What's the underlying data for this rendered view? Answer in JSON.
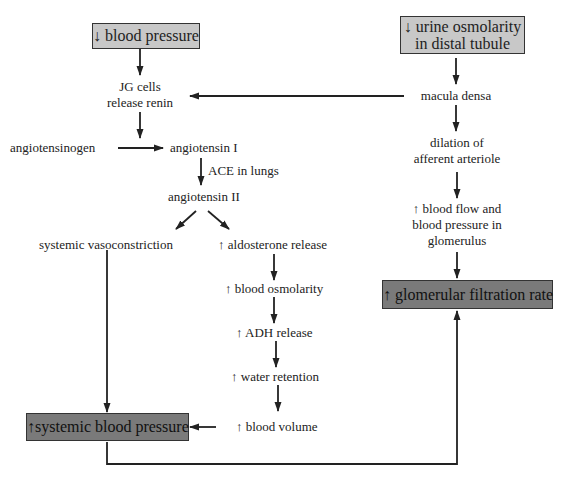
{
  "diagram": {
    "colors": {
      "start_box_fill": "#c8c8c8",
      "end_box_fill": "#7a7a7a",
      "arrow": "#222222",
      "text": "#222222"
    },
    "nodes": {
      "decreased_bp": {
        "text": "↓ blood pressure",
        "style": "light-box"
      },
      "decreased_urine_osm": {
        "lines": [
          "↓ urine osmolarity",
          "in distal tubule"
        ],
        "style": "light-box"
      },
      "jg_cells": {
        "lines": [
          "JG cells",
          "release renin"
        ]
      },
      "macula_densa": {
        "text": "macula densa"
      },
      "angiotensinogen": {
        "text": "angiotensinogen"
      },
      "angiotensin_1": {
        "text": "angiotensin I"
      },
      "ace_label": {
        "text": "ACE in lungs"
      },
      "angiotensin_2": {
        "text": "angiotensin II"
      },
      "dilation": {
        "lines": [
          "dilation of",
          "afferent arteriole"
        ]
      },
      "blood_flow": {
        "lines": [
          "↑ blood flow and",
          "blood pressure in",
          "glomerulus"
        ]
      },
      "vasoconstriction": {
        "text": "systemic vasoconstriction"
      },
      "aldosterone": {
        "text": "↑ aldosterone release"
      },
      "blood_osm": {
        "text": "↑ blood osmolarity"
      },
      "adh": {
        "text": "↑ ADH release"
      },
      "water_retention": {
        "text": "↑ water retention"
      },
      "blood_volume": {
        "text": "↑ blood volume"
      },
      "systemic_bp": {
        "text": "↑systemic blood pressure",
        "style": "dark-box"
      },
      "gfr": {
        "text": "↑ glomerular filtration rate",
        "style": "dark-box"
      }
    },
    "edges": [
      {
        "from": "decreased_bp",
        "to": "jg_cells"
      },
      {
        "from": "decreased_urine_osm",
        "to": "macula_densa"
      },
      {
        "from": "macula_densa",
        "to": "jg_cells"
      },
      {
        "from": "macula_densa",
        "to": "dilation"
      },
      {
        "from": "jg_cells",
        "to": "angiotensin_1"
      },
      {
        "from": "angiotensinogen",
        "to": "angiotensin_1"
      },
      {
        "from": "angiotensin_1",
        "to": "angiotensin_2",
        "label": "ACE in lungs"
      },
      {
        "from": "angiotensin_2",
        "to": "vasoconstriction"
      },
      {
        "from": "angiotensin_2",
        "to": "aldosterone"
      },
      {
        "from": "aldosterone",
        "to": "blood_osm"
      },
      {
        "from": "blood_osm",
        "to": "adh"
      },
      {
        "from": "adh",
        "to": "water_retention"
      },
      {
        "from": "water_retention",
        "to": "blood_volume"
      },
      {
        "from": "blood_volume",
        "to": "systemic_bp"
      },
      {
        "from": "vasoconstriction",
        "to": "systemic_bp"
      },
      {
        "from": "dilation",
        "to": "blood_flow"
      },
      {
        "from": "blood_flow",
        "to": "gfr"
      },
      {
        "from": "systemic_bp",
        "to": "gfr"
      }
    ]
  }
}
